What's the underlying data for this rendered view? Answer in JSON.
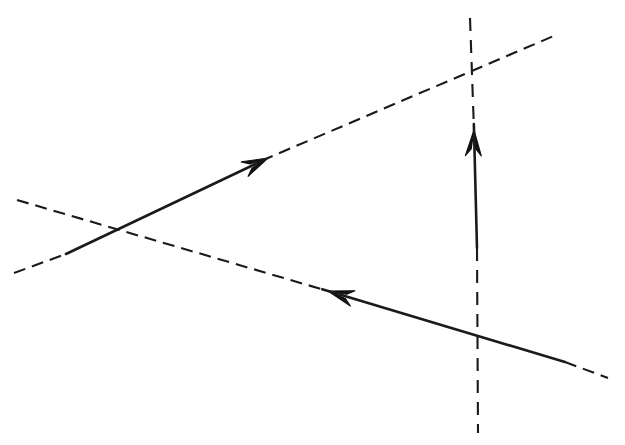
{
  "canvas": {
    "width": 625,
    "height": 445,
    "background_color": "#ffffff",
    "title": "",
    "caption": ""
  },
  "style": {
    "stroke_color": "#1a1a1a",
    "solid_stroke_width": 2.6,
    "dashed_stroke_width": 2.1,
    "dash_pattern": "12 7",
    "vertical_dash_pattern": "13 9",
    "arrowhead_color": "#111111"
  },
  "chart_data": {
    "type": "diagram",
    "subtype": "vector-line-diagram",
    "title": "",
    "xlabel": "",
    "ylabel": "",
    "grid": false,
    "legend": "none",
    "xlim": [
      0,
      625
    ],
    "ylim": [
      0,
      445
    ],
    "elements": [
      {
        "name": "ascending-line",
        "direction": "up-right",
        "start": [
          14,
          273
        ],
        "end": [
          556,
          35
        ],
        "solid_segment": [
          [
            66,
            254
          ],
          [
            268,
            158
          ]
        ],
        "arrow": {
          "at": [
            268,
            158
          ],
          "points_to": "up-right",
          "angle_deg": -25.5
        },
        "dashed_segments": [
          [
            [
              14,
              273
            ],
            [
              66,
              254
            ]
          ],
          [
            [
              268,
              158
            ],
            [
              556,
              35
            ]
          ]
        ]
      },
      {
        "name": "descending-line",
        "direction": "down-right",
        "start": [
          17,
          200
        ],
        "end": [
          608,
          378
        ],
        "solid_segment": [
          [
            328,
            291
          ],
          [
            565,
            362
          ]
        ],
        "arrow": {
          "at": [
            328,
            291
          ],
          "points_to": "up-left",
          "angle_deg": 196.7
        },
        "dashed_segments": [
          [
            [
              17,
              200
            ],
            [
              328,
              291
            ]
          ],
          [
            [
              565,
              362
            ],
            [
              608,
              378
            ]
          ]
        ]
      },
      {
        "name": "vertical-line",
        "direction": "up",
        "start": [
          478,
          433
        ],
        "end": [
          470,
          18
        ],
        "solid_segment": [
          [
            474,
            130
          ],
          [
            477,
            248
          ]
        ],
        "arrow": {
          "at": [
            474,
            130
          ],
          "points_to": "up",
          "angle_deg": -88.5
        },
        "dashed_segments": [
          [
            [
              477,
              248
            ],
            [
              478,
              433
            ]
          ],
          [
            [
              470,
              18
            ],
            [
              474,
              130
            ]
          ]
        ]
      }
    ],
    "intersections": [
      {
        "name": "left-crossing",
        "point": [
          117,
          230
        ],
        "between": [
          "ascending-line",
          "descending-line"
        ]
      },
      {
        "name": "upper-right-crossing",
        "point": [
          471,
          68
        ],
        "between": [
          "ascending-line",
          "vertical-line"
        ]
      },
      {
        "name": "lower-right-crossing",
        "point": [
          478,
          340
        ],
        "between": [
          "descending-line",
          "vertical-line"
        ]
      }
    ]
  }
}
